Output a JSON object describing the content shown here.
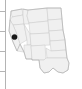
{
  "figure": {
    "kind": "thumbnail-choropleth-map",
    "width": 82,
    "height": 89,
    "background_color": "#ffffff",
    "title": "",
    "subtitle": "",
    "caption": "",
    "region_described": "Western and Southwestern United States"
  },
  "axis": {
    "visible": true,
    "orientation": "vertical",
    "position": "left",
    "spine_color": "#b4b4b4",
    "spine_x": 5,
    "spine_y_top": 0,
    "spine_y_bottom": 89,
    "tick_color": "#b4b4b4",
    "tick_length": 5,
    "tick_side": "outward-left",
    "tick_labels": [],
    "ticks_y": [
      11,
      31,
      51,
      71
    ],
    "axis_label": ""
  },
  "map_style": {
    "land_fill": "#f0f0f0",
    "border_color": "#c8c8c8",
    "outer_border_color": "#b0b0b0",
    "highlight_fill": "#1a1a1a",
    "highlight_border_color": "#000000",
    "border_width": 0.5
  },
  "legend": {
    "visible": false,
    "entries": []
  },
  "highlight": {
    "label": "",
    "count": 1,
    "center_x": 14.5,
    "center_y": 37,
    "radius": 2.6,
    "color": "#1a1a1a"
  },
  "regions": [
    {
      "name": "washington",
      "highlighted": false
    },
    {
      "name": "oregon",
      "highlighted": false
    },
    {
      "name": "idaho",
      "highlighted": false
    },
    {
      "name": "montana",
      "highlighted": false
    },
    {
      "name": "wyoming",
      "highlighted": false
    },
    {
      "name": "north-dakota",
      "highlighted": false
    },
    {
      "name": "south-dakota",
      "highlighted": false
    },
    {
      "name": "nebraska",
      "highlighted": false
    },
    {
      "name": "california",
      "highlighted": true
    },
    {
      "name": "nevada",
      "highlighted": false
    },
    {
      "name": "utah",
      "highlighted": false
    },
    {
      "name": "colorado",
      "highlighted": false
    },
    {
      "name": "kansas",
      "highlighted": false
    },
    {
      "name": "arizona",
      "highlighted": false
    },
    {
      "name": "new-mexico",
      "highlighted": false
    },
    {
      "name": "oklahoma",
      "highlighted": false
    },
    {
      "name": "texas",
      "highlighted": false
    }
  ]
}
